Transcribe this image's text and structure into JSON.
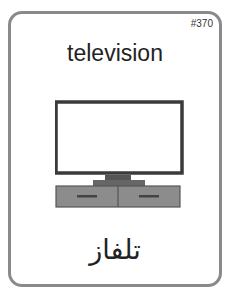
{
  "card": {
    "number": "#370",
    "english_word": "television",
    "arabic_word": "تلفاز",
    "illustration": "television-icon",
    "colors": {
      "border": "#8a8a8a",
      "tv_frame": "#3a3a3a",
      "stand": "#555555",
      "cabinet": "#8c8c8c"
    }
  }
}
